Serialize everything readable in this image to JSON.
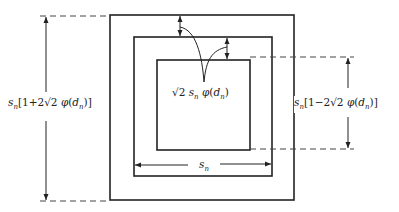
{
  "diagram": {
    "type": "nested-squares-dimension-diagram",
    "colors": {
      "stroke": "#222222",
      "background": "#ffffff"
    },
    "squares": [
      {
        "name": "outer",
        "x1": 110,
        "y1": 15,
        "x2": 294,
        "y2": 200
      },
      {
        "name": "middle",
        "x1": 134,
        "y1": 37,
        "x2": 272,
        "y2": 176
      },
      {
        "name": "inner",
        "x1": 157,
        "y1": 60,
        "x2": 250,
        "y2": 150
      }
    ],
    "labels": {
      "outer_dimension": "s_n[1+2√2 φ(d_n)]",
      "inner_dimension": "s_n[1−2√2 φ(d_n)]",
      "gap": "√2 s_n φ(d_n)",
      "middle_width": "s_n"
    }
  }
}
